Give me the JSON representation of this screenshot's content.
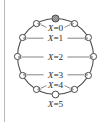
{
  "figure": {
    "type": "cycle-graph-diagram",
    "node_count": 12,
    "marked_node": {
      "name": "root-node",
      "position": "top",
      "style": "hatched-filled",
      "fill_color": "#9a9a9a"
    },
    "colors": {
      "edge": "#4a4a4a",
      "node_stroke": "#4a4a4a",
      "node_fill": "#ffffff",
      "arrow": "#6f6f6f",
      "text": "#2b2b2b",
      "rule": "#b9b9b9",
      "background": "#ffffff"
    },
    "levels": [
      {
        "id": "level-0",
        "label": "X=0",
        "variable": "X",
        "value": "0",
        "has_arrow": true,
        "node_count": 2
      },
      {
        "id": "level-1",
        "label": "X=1",
        "variable": "X",
        "value": "1",
        "has_arrow": true,
        "node_count": 2
      },
      {
        "id": "level-2",
        "label": "X=2",
        "variable": "X",
        "value": "2",
        "has_arrow": true,
        "node_count": 2
      },
      {
        "id": "level-3",
        "label": "X=3",
        "variable": "X",
        "value": "3",
        "has_arrow": true,
        "node_count": 2
      },
      {
        "id": "level-4",
        "label": "X=4",
        "variable": "X",
        "value": "4",
        "has_arrow": true,
        "node_count": 2
      },
      {
        "id": "level-5",
        "label": "X=5",
        "variable": "X",
        "value": "5",
        "has_arrow": false,
        "node_count": 1
      }
    ]
  },
  "chart_data": {
    "type": "diagram",
    "title": "",
    "xlabel": "",
    "ylabel": "",
    "categories": [
      "X=0",
      "X=1",
      "X=2",
      "X=3",
      "X=4",
      "X=5"
    ],
    "values": [
      2,
      2,
      2,
      2,
      2,
      1
    ],
    "annotations": [
      "X=0",
      "X=1",
      "X=2",
      "X=3",
      "X=4",
      "X=5"
    ]
  }
}
